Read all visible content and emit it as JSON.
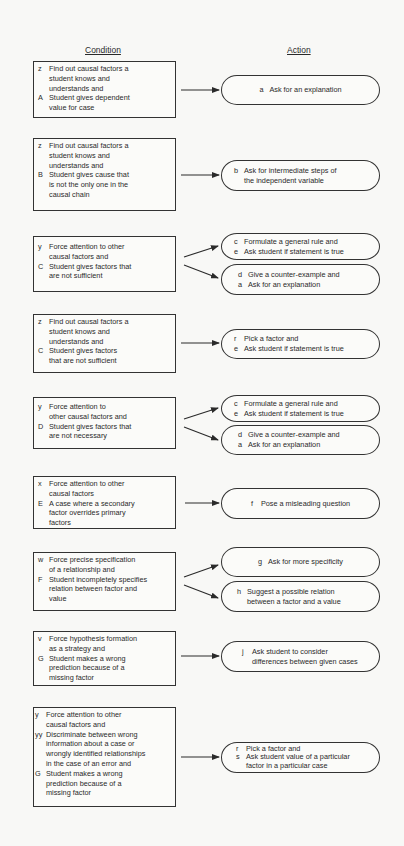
{
  "headers": {
    "condition": "Condition",
    "action": "Action"
  },
  "colors": {
    "background": "#f8f8f6",
    "ink": "#2a2a2a"
  },
  "rules": [
    {
      "condition": [
        {
          "label": "z",
          "text": "Find out causal factors a"
        },
        {
          "label": "",
          "text": "student knows and"
        },
        {
          "label": "",
          "text": "understands and"
        },
        {
          "label": "A",
          "text": "Student gives dependent"
        },
        {
          "label": "",
          "text": "value for case"
        }
      ],
      "actions": [
        [
          {
            "label": "a",
            "text": "Ask for an explanation"
          }
        ]
      ]
    },
    {
      "condition": [
        {
          "label": "z",
          "text": "Find out causal factors a"
        },
        {
          "label": "",
          "text": "student knows and"
        },
        {
          "label": "",
          "text": "understands and"
        },
        {
          "label": "B",
          "text": "Student gives cause that"
        },
        {
          "label": "",
          "text": "is not the only one in the"
        },
        {
          "label": "",
          "text": "causal chain"
        }
      ],
      "actions": [
        [
          {
            "label": "b",
            "text": "Ask for intermediate steps of"
          },
          {
            "label": "",
            "text": "the independent variable"
          }
        ]
      ]
    },
    {
      "condition": [
        {
          "label": "y",
          "text": "Force attention to other"
        },
        {
          "label": "",
          "text": "causal factors and"
        },
        {
          "label": "C",
          "text": "Student gives factors that"
        },
        {
          "label": "",
          "text": "are not sufficient"
        }
      ],
      "actions": [
        [
          {
            "label": "c",
            "text": "Formulate a general rule and"
          },
          {
            "label": "e",
            "text": "Ask student if statement is true"
          }
        ],
        [
          {
            "label": "d",
            "text": "Give a counter-example and"
          },
          {
            "label": "a",
            "text": "Ask for an explanation"
          }
        ]
      ]
    },
    {
      "condition": [
        {
          "label": "z",
          "text": "Find out causal factors a"
        },
        {
          "label": "",
          "text": "student knows and"
        },
        {
          "label": "",
          "text": "understands and"
        },
        {
          "label": "C",
          "text": "Student gives factors"
        },
        {
          "label": "",
          "text": "that are not sufficient"
        }
      ],
      "actions": [
        [
          {
            "label": "r",
            "text": "Pick a factor and"
          },
          {
            "label": "e",
            "text": "Ask student if statement is true"
          }
        ]
      ]
    },
    {
      "condition": [
        {
          "label": "y",
          "text": "Force attention to"
        },
        {
          "label": "",
          "text": "other causal factors and"
        },
        {
          "label": "D",
          "text": "Student gives factors that"
        },
        {
          "label": "",
          "text": "are not necessary"
        }
      ],
      "actions": [
        [
          {
            "label": "c",
            "text": "Formulate a general rule and"
          },
          {
            "label": "e",
            "text": "Ask student if statement is true"
          }
        ],
        [
          {
            "label": "d",
            "text": "Give a counter-example and"
          },
          {
            "label": "a",
            "text": "Ask for an explanation"
          }
        ]
      ]
    },
    {
      "condition": [
        {
          "label": "x",
          "text": "Force attention to other"
        },
        {
          "label": "",
          "text": "causal factors"
        },
        {
          "label": "E",
          "text": "A case where a secondary"
        },
        {
          "label": "",
          "text": "factor overrides primary"
        },
        {
          "label": "",
          "text": "factors"
        }
      ],
      "actions": [
        [
          {
            "label": "f",
            "text": "Pose a misleading question"
          }
        ]
      ]
    },
    {
      "condition": [
        {
          "label": "w",
          "text": "Force precise specification"
        },
        {
          "label": "",
          "text": "of a relationship and"
        },
        {
          "label": "F",
          "text": "Student incompletely specifies"
        },
        {
          "label": "",
          "text": "relation between factor and"
        },
        {
          "label": "",
          "text": "value"
        }
      ],
      "actions": [
        [
          {
            "label": "g",
            "text": "Ask for more specificity"
          }
        ],
        [
          {
            "label": "h",
            "text": "Suggest a possible relation"
          },
          {
            "label": "",
            "text": "between a factor and a value"
          }
        ]
      ]
    },
    {
      "condition": [
        {
          "label": "v",
          "text": "Force hypothesis formation"
        },
        {
          "label": "",
          "text": "as a strategy and"
        },
        {
          "label": "G",
          "text": "Student makes a wrong"
        },
        {
          "label": "",
          "text": "prediction because of a"
        },
        {
          "label": "",
          "text": "missing factor"
        }
      ],
      "actions": [
        [
          {
            "label": "j",
            "text": "Ask student to consider"
          },
          {
            "label": "",
            "text": "differences between given cases"
          }
        ]
      ]
    },
    {
      "condition": [
        {
          "label": "y",
          "text": "Force attention to other"
        },
        {
          "label": "",
          "text": "causal factors and"
        },
        {
          "label": "yy",
          "text": "Discriminate between wrong"
        },
        {
          "label": "",
          "text": "information about a case or"
        },
        {
          "label": "",
          "text": "wrongly identified relationships"
        },
        {
          "label": "",
          "text": "in the case of an error and"
        },
        {
          "label": "G",
          "text": "Student makes a wrong"
        },
        {
          "label": "",
          "text": "prediction because of a"
        },
        {
          "label": "",
          "text": "missing factor"
        }
      ],
      "actions": [
        [
          {
            "label": "r",
            "text": "Pick a factor and"
          },
          {
            "label": "s",
            "text": "Ask student value of a particular"
          },
          {
            "label": "",
            "text": "factor in a particular case"
          }
        ]
      ]
    }
  ]
}
